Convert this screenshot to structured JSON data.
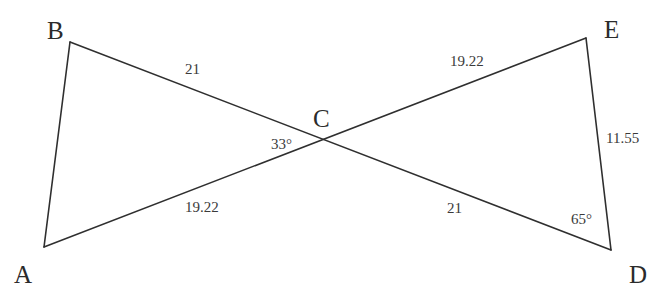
{
  "figure": {
    "kind": "geometry-diagram",
    "background_color": "#ffffff",
    "stroke_color": "#2f2f2f",
    "text_color": "#2b2b2b",
    "stroke_width": 1.6
  },
  "vertices": [
    {
      "id": "B",
      "label": "B",
      "x": 70,
      "y": 42,
      "label_x": 47,
      "label_y": 18
    },
    {
      "id": "A",
      "label": "A",
      "x": 44,
      "y": 247,
      "label_x": 14,
      "label_y": 262
    },
    {
      "id": "C",
      "label": "C",
      "x": 329,
      "y": 143,
      "label_x": 313,
      "label_y": 106
    },
    {
      "id": "E",
      "label": "E",
      "x": 586,
      "y": 38,
      "label_x": 604,
      "label_y": 17
    },
    {
      "id": "D",
      "label": "D",
      "x": 611,
      "y": 250,
      "label_x": 629,
      "label_y": 262
    }
  ],
  "segments": [
    {
      "id": "AB",
      "from": "A",
      "to": "B"
    },
    {
      "id": "BD",
      "from": "B",
      "to": "D"
    },
    {
      "id": "AE",
      "from": "A",
      "to": "E"
    },
    {
      "id": "ED",
      "from": "E",
      "to": "D"
    }
  ],
  "measures": [
    {
      "id": "BC",
      "text": "21",
      "x": 185,
      "y": 62,
      "on": "segment-bc"
    },
    {
      "id": "CE",
      "text": "19.22",
      "x": 450,
      "y": 54,
      "on": "segment-ce"
    },
    {
      "id": "AC",
      "text": "19.22",
      "x": 185,
      "y": 200,
      "on": "segment-ac"
    },
    {
      "id": "CD",
      "text": "21",
      "x": 447,
      "y": 201,
      "on": "segment-cd"
    },
    {
      "id": "ED",
      "text": "11.55",
      "x": 606,
      "y": 131,
      "on": "segment-ed"
    }
  ],
  "angles": [
    {
      "id": "ACB",
      "text": "33°",
      "x": 271,
      "y": 137,
      "at": "C"
    },
    {
      "id": "EDC",
      "text": "65°",
      "x": 571,
      "y": 212,
      "at": "D"
    }
  ],
  "chart_data": {
    "type": "diagram",
    "title": "",
    "shapes": [
      {
        "name": "triangle-ABC",
        "points": [
          {
            "label": "A",
            "x": 44,
            "y": 247
          },
          {
            "label": "B",
            "x": 70,
            "y": 42
          },
          {
            "label": "C",
            "x": 329,
            "y": 143
          }
        ],
        "side_labels": {
          "BC": "21",
          "AC": "19.22"
        },
        "angle_labels": {
          "C": "33°"
        }
      },
      {
        "name": "triangle-CDE",
        "points": [
          {
            "label": "C",
            "x": 329,
            "y": 143
          },
          {
            "label": "E",
            "x": 586,
            "y": 38
          },
          {
            "label": "D",
            "x": 611,
            "y": 250
          }
        ],
        "side_labels": {
          "CE": "19.22",
          "CD": "21",
          "ED": "11.55"
        },
        "angle_labels": {
          "D": "65°"
        }
      }
    ]
  }
}
